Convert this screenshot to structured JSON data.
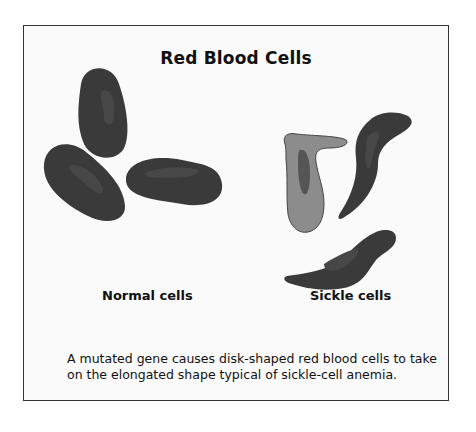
{
  "title": "Red Blood Cells",
  "labels": {
    "normal": "Normal cells",
    "sickle": "Sickle cells"
  },
  "caption": "A mutated gene causes disk-shaped red blood cells to take on the elongated shape typical of sickle-cell anemia.",
  "colors": {
    "cell_dark": "#3a3a3a",
    "cell_highlight": "#4a4a4a",
    "sickle_light": "#8c8c8c",
    "sickle_light_inner": "#555555",
    "frame_border": "#333333",
    "background": "#fafafa"
  }
}
